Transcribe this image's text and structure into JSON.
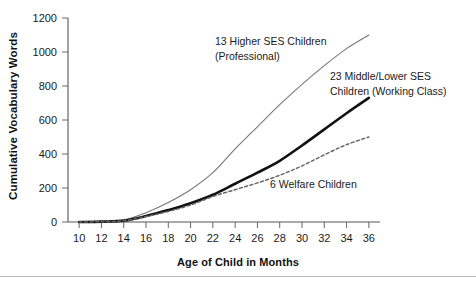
{
  "chart_data": {
    "type": "line",
    "title": "",
    "xlabel": "Age of Child in Months",
    "ylabel": "Cumulative Vocabulary Words",
    "xlim": [
      9,
      37
    ],
    "ylim": [
      0,
      1200
    ],
    "xticks": [
      10,
      12,
      14,
      16,
      18,
      20,
      22,
      24,
      26,
      28,
      30,
      32,
      34,
      36
    ],
    "yticks": [
      0,
      200,
      400,
      600,
      800,
      1000,
      1200
    ],
    "grid": false,
    "legend": "annotations-inline",
    "x": [
      10,
      12,
      14,
      16,
      18,
      20,
      22,
      24,
      26,
      28,
      30,
      32,
      34,
      36
    ],
    "series": [
      {
        "name": "13 Higher SES Children (Professional)",
        "label_line1": "13 Higher SES Children",
        "label_line2": "(Professional)",
        "color": "#777777",
        "style": "solid-thin",
        "values": [
          0,
          2,
          10,
          55,
          115,
          190,
          290,
          430,
          560,
          690,
          810,
          920,
          1020,
          1100
        ]
      },
      {
        "name": "23 Middle/Lower SES Children (Working Class)",
        "label_line1": "23 Middle/Lower SES",
        "label_line2": "Children (Working Class)",
        "color": "#111111",
        "style": "solid-thick",
        "values": [
          0,
          2,
          8,
          35,
          70,
          110,
          160,
          225,
          290,
          360,
          450,
          545,
          640,
          730
        ]
      },
      {
        "name": "6 Welfare Children",
        "label_line1": "6 Welfare Children",
        "label_line2": "",
        "color": "#666666",
        "style": "dashed",
        "values": [
          0,
          2,
          8,
          32,
          62,
          100,
          150,
          190,
          230,
          275,
          330,
          395,
          455,
          500
        ]
      }
    ],
    "annotations": [
      {
        "id": "annot-higher-ses",
        "line1": "13 Higher SES Children",
        "line2": "(Professional)"
      },
      {
        "id": "annot-middle-ses",
        "line1": "23 Middle/Lower SES",
        "line2": "Children (Working Class)"
      },
      {
        "id": "annot-welfare",
        "line1": "6 Welfare Children",
        "line2": ""
      }
    ]
  }
}
